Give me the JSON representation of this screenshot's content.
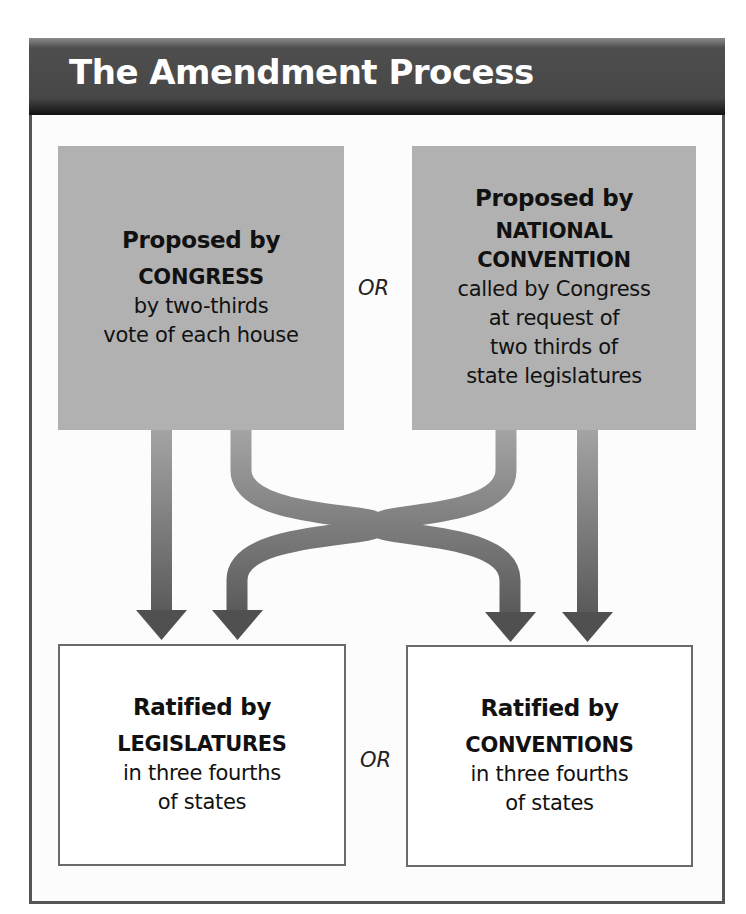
{
  "title": "The Amendment Process",
  "proposal": {
    "congress": {
      "lead": "Proposed by",
      "key": "CONGRESS",
      "desc_lines": [
        "by two-thirds",
        "vote of each house"
      ]
    },
    "connector": "OR",
    "convention": {
      "lead": "Proposed by",
      "key_lines": [
        "NATIONAL",
        "CONVENTION"
      ],
      "desc_lines": [
        "called by Congress",
        "at request of",
        "two thirds of",
        "state legislatures"
      ]
    }
  },
  "ratification": {
    "legislatures": {
      "lead": "Ratified by",
      "key": "LEGISLATURES",
      "desc_lines": [
        "in three fourths",
        "of states"
      ]
    },
    "connector": "OR",
    "conventions": {
      "lead": "Ratified by",
      "key": "CONVENTIONS",
      "desc_lines": [
        "in three fourths",
        "of states"
      ]
    }
  },
  "colors": {
    "header_bg": "#474747",
    "header_text": "#ffffff",
    "proposal_box": "#b1b1b1",
    "arrow_top": "#9a9a9a",
    "arrow_bottom": "#555555",
    "border": "#555555"
  }
}
